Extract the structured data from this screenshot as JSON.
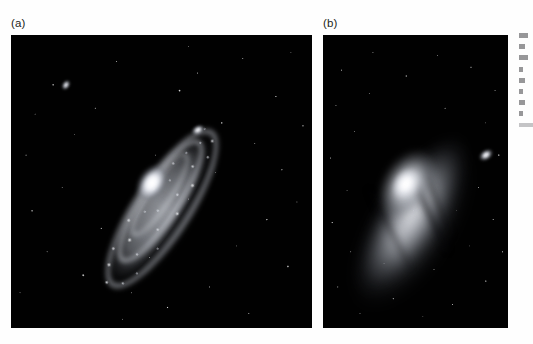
{
  "figure": {
    "kind": "two-panel astronomical image plate",
    "background_color": "#ffffff",
    "panels": [
      {
        "label": "(a)",
        "label_name": "panel-label-a",
        "band": "blue / ultraviolet light",
        "description": "Clumpy spiral-arm structure with bright star-forming knots arranged in rings around a compact bright nucleus; two elliptical companion galaxies visible.",
        "frame_color": "#000000",
        "features": [
          "bright compact nucleus",
          "inner ring of knots",
          "outer ring of knots",
          "companion galaxy M32 (upper right of centre)",
          "companion galaxy NGC 205 / M110 (upper left)",
          "foreground star field"
        ]
      },
      {
        "label": "(b)",
        "label_name": "panel-label-b",
        "band": "red / infrared light",
        "description": "Smooth diffuse stellar disk and large bright bulge with dark dust lanes; the same companion galaxy appears at right.",
        "frame_color": "#000000",
        "features": [
          "large smooth bulge",
          "diffuse stellar disk",
          "dark dust lanes",
          "bright knot in lower disk",
          "companion galaxy M32 (right edge)",
          "foreground star field"
        ]
      }
    ]
  },
  "caption_strip": {
    "note": "partially cropped body-text column at the right page edge",
    "visible": true,
    "lines": [
      "long",
      "mid",
      "long",
      "short",
      "mid",
      "short",
      "mid",
      "short",
      "faint"
    ]
  },
  "colors": {
    "page_background": "#ffffff",
    "panel_background": "#000000",
    "label_text": "#231f20",
    "star_highlight": "#ffffff"
  }
}
